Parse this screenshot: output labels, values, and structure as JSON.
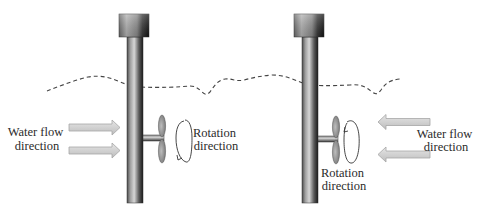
{
  "diagram": {
    "panels": [
      {
        "id": "left",
        "flow_label": [
          "Water flow",
          "direction"
        ],
        "rotation_label": [
          "Rotation",
          "direction"
        ],
        "flow_direction": "left-to-right",
        "rotation_sense": "counterclockwise-arrowhead-bottom-left"
      },
      {
        "id": "right",
        "flow_label": [
          "Water flow",
          "direction"
        ],
        "rotation_label": [
          "Rotation",
          "direction"
        ],
        "flow_direction": "right-to-left",
        "rotation_sense": "arrowhead-top-left"
      }
    ],
    "elements": {
      "water_surface": "dashed-line",
      "turbine_pole": "vertical-cylinder",
      "turbine_cap": "rectangular-housing",
      "rotor": "two-blade-propeller"
    },
    "colors": {
      "pole_light": "#d8d8d8",
      "pole_dark": "#1e1e1e",
      "arrow_fill": "#d4d4d4",
      "arrow_stroke": "#a6a6a6",
      "blade_fill": "#9a9a9a",
      "line": "#444444"
    }
  }
}
